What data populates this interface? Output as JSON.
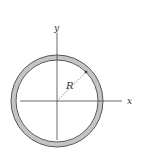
{
  "diagram": {
    "type": "thin-ring-cross-section",
    "labels": {
      "y_axis": "y",
      "x_axis": "x",
      "radius": "R"
    },
    "colors": {
      "ring_fill": "#c4c4c4",
      "ring_outline": "#555555",
      "axis": "#444444",
      "radius_line": "#666666",
      "text": "#333333"
    }
  }
}
